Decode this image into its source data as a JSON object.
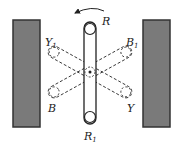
{
  "diagram": {
    "labels": {
      "R": "R",
      "R1": "R",
      "R1_sub": "1",
      "Y1": "Y",
      "Y1_sub": "1",
      "B1": "B",
      "B1_sub": "1",
      "B": "B",
      "Y": "Y"
    },
    "colors": {
      "wall_fill": "#7a7a7a",
      "wall_stroke": "#333333",
      "line": "#222222"
    },
    "rotation_direction": "counterclockwise"
  }
}
